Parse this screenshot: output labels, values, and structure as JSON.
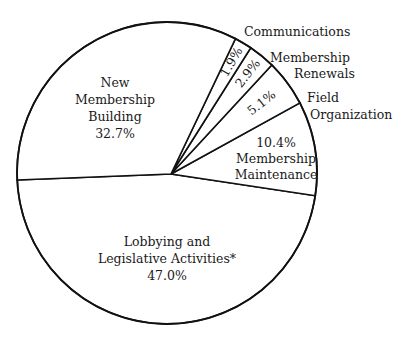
{
  "chart_data": {
    "type": "pie",
    "title": "",
    "slices": [
      {
        "label": "Lobbying and Legislative Activities*",
        "value": 47.0,
        "value_label": "47.0%"
      },
      {
        "label": "Membership Maintenance",
        "value": 10.4,
        "value_label": "10.4%"
      },
      {
        "label": "Field Organization",
        "value": 5.1,
        "value_label": "5.1%"
      },
      {
        "label": "Membership Renewals",
        "value": 2.9,
        "value_label": "2.9%"
      },
      {
        "label": "Communications",
        "value": 1.9,
        "value_label": "1.9%"
      },
      {
        "label": "New Membership Building",
        "value": 32.7,
        "value_label": "32.7%"
      }
    ],
    "legend": "none",
    "labels": {
      "new_membership": [
        "New",
        "Membership",
        "Building",
        "32.7%"
      ],
      "lobbying": [
        "Lobbying and",
        "Legislative Activities*",
        "47.0%"
      ],
      "maintenance": [
        "10.4%",
        "Membership",
        "Maintenance"
      ],
      "field": [
        "Field",
        "Organization"
      ],
      "field_pct": "5.1%",
      "renewals": [
        "Membership",
        "Renewals"
      ],
      "renewals_pct": "2.9%",
      "communications": [
        "Communications"
      ],
      "communications_pct": "1.9%"
    }
  }
}
